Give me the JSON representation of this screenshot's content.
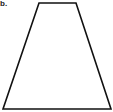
{
  "figure": {
    "label": "b.",
    "shape": "trapezoid",
    "stroke_color": "#111111",
    "fill_color": "#ffffff",
    "vertices": {
      "top_left": [
        39,
        3
      ],
      "top_right": [
        76,
        3
      ],
      "bottom_right": [
        111,
        109
      ],
      "bottom_left": [
        3,
        109
      ]
    }
  }
}
